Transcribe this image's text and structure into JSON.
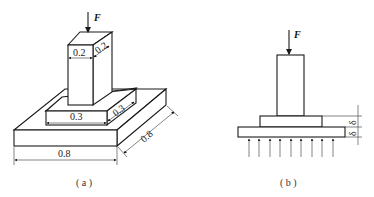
{
  "figure_a": {
    "force_label": "F",
    "column_width_label": "0.2",
    "column_depth_label": "0.2",
    "middle_width_label": "0.3",
    "middle_depth_label": "0.3",
    "base_width_label": "0.8",
    "base_depth_label": "0.8",
    "caption": "( a )"
  },
  "figure_b": {
    "force_label": "F",
    "thickness_upper_label": "δ",
    "thickness_lower_label": "δ",
    "caption": "( b )",
    "reaction_arrow_count": 9
  },
  "colors": {
    "line": "#1a1a1a",
    "background": "#ffffff"
  }
}
